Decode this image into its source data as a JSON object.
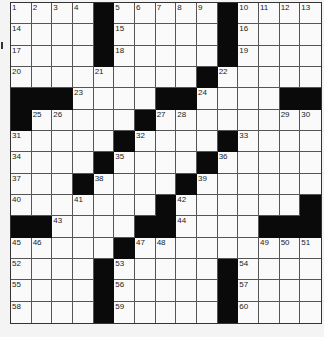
{
  "puzzle": {
    "rows": 15,
    "cols": 15,
    "colors": {
      "black": "#0a0a0a",
      "white": "#fafafa",
      "line": "#555555"
    },
    "layout": [
      "....#.....#....",
      "....#.....#....",
      "....#.....#....",
      ".........#.....",
      "###....##....##",
      "#.....#........",
      ".....#....#....",
      "....#....#.....",
      "...#....#......",
      ".......#......#",
      "##....##....###",
      ".....#.........",
      "....#.....#....",
      "....#.....#....",
      "....#.....#...."
    ],
    "numbers": [
      {
        "r": 0,
        "c": 0,
        "n": "1"
      },
      {
        "r": 0,
        "c": 1,
        "n": "2"
      },
      {
        "r": 0,
        "c": 2,
        "n": "3"
      },
      {
        "r": 0,
        "c": 3,
        "n": "4"
      },
      {
        "r": 0,
        "c": 5,
        "n": "5"
      },
      {
        "r": 0,
        "c": 6,
        "n": "6"
      },
      {
        "r": 0,
        "c": 7,
        "n": "7"
      },
      {
        "r": 0,
        "c": 8,
        "n": "8"
      },
      {
        "r": 0,
        "c": 9,
        "n": "9"
      },
      {
        "r": 0,
        "c": 11,
        "n": "10"
      },
      {
        "r": 0,
        "c": 12,
        "n": "11"
      },
      {
        "r": 0,
        "c": 13,
        "n": "12"
      },
      {
        "r": 0,
        "c": 14,
        "n": "13"
      },
      {
        "r": 1,
        "c": 0,
        "n": "14"
      },
      {
        "r": 1,
        "c": 5,
        "n": "15"
      },
      {
        "r": 1,
        "c": 11,
        "n": "16"
      },
      {
        "r": 2,
        "c": 0,
        "n": "17"
      },
      {
        "r": 2,
        "c": 5,
        "n": "18"
      },
      {
        "r": 2,
        "c": 11,
        "n": "19"
      },
      {
        "r": 3,
        "c": 0,
        "n": "20"
      },
      {
        "r": 3,
        "c": 4,
        "n": "21"
      },
      {
        "r": 3,
        "c": 10,
        "n": "22"
      },
      {
        "r": 4,
        "c": 3,
        "n": "23"
      },
      {
        "r": 4,
        "c": 9,
        "n": "24"
      },
      {
        "r": 5,
        "c": 1,
        "n": "25"
      },
      {
        "r": 5,
        "c": 2,
        "n": "26"
      },
      {
        "r": 5,
        "c": 7,
        "n": "27"
      },
      {
        "r": 5,
        "c": 8,
        "n": "28"
      },
      {
        "r": 5,
        "c": 13,
        "n": "29"
      },
      {
        "r": 5,
        "c": 14,
        "n": "30"
      },
      {
        "r": 6,
        "c": 0,
        "n": "31"
      },
      {
        "r": 6,
        "c": 6,
        "n": "32"
      },
      {
        "r": 6,
        "c": 11,
        "n": "33"
      },
      {
        "r": 7,
        "c": 0,
        "n": "34"
      },
      {
        "r": 7,
        "c": 5,
        "n": "35"
      },
      {
        "r": 7,
        "c": 10,
        "n": "36"
      },
      {
        "r": 8,
        "c": 0,
        "n": "37"
      },
      {
        "r": 8,
        "c": 4,
        "n": "38"
      },
      {
        "r": 8,
        "c": 9,
        "n": "39"
      },
      {
        "r": 9,
        "c": 0,
        "n": "40"
      },
      {
        "r": 9,
        "c": 3,
        "n": "41"
      },
      {
        "r": 9,
        "c": 8,
        "n": "42"
      },
      {
        "r": 10,
        "c": 2,
        "n": "43"
      },
      {
        "r": 10,
        "c": 8,
        "n": "44"
      },
      {
        "r": 11,
        "c": 0,
        "n": "45"
      },
      {
        "r": 11,
        "c": 1,
        "n": "46"
      },
      {
        "r": 11,
        "c": 6,
        "n": "47"
      },
      {
        "r": 11,
        "c": 7,
        "n": "48"
      },
      {
        "r": 11,
        "c": 12,
        "n": "49"
      },
      {
        "r": 11,
        "c": 13,
        "n": "50"
      },
      {
        "r": 11,
        "c": 14,
        "n": "51"
      },
      {
        "r": 12,
        "c": 0,
        "n": "52"
      },
      {
        "r": 12,
        "c": 5,
        "n": "53"
      },
      {
        "r": 12,
        "c": 11,
        "n": "54"
      },
      {
        "r": 13,
        "c": 0,
        "n": "55"
      },
      {
        "r": 13,
        "c": 5,
        "n": "56"
      },
      {
        "r": 13,
        "c": 11,
        "n": "57"
      },
      {
        "r": 14,
        "c": 0,
        "n": "58"
      },
      {
        "r": 14,
        "c": 5,
        "n": "59"
      },
      {
        "r": 14,
        "c": 11,
        "n": "60"
      }
    ]
  }
}
